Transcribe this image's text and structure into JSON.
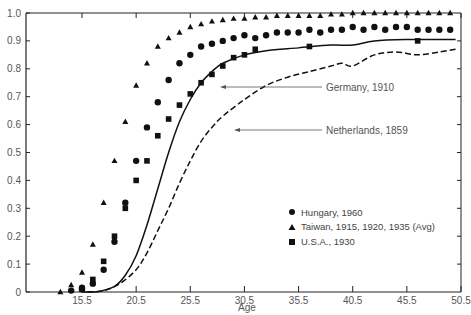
{
  "chart_data": {
    "type": "scatter",
    "title": "",
    "xlabel": "Age",
    "ylabel": "",
    "xlim": [
      10.5,
      50.5
    ],
    "ylim": [
      0,
      1.0
    ],
    "grid": false,
    "legend_position": "lower right",
    "x_ticks": [
      15.5,
      20.5,
      25.5,
      30.5,
      35.5,
      40.5,
      45.5,
      50.5
    ],
    "x_tick_labels": [
      "15.5",
      "20.5",
      "25.5",
      "30.5",
      "35.5",
      "40.5",
      "45.5",
      "50.5"
    ],
    "y_ticks": [
      0,
      0.1,
      0.2,
      0.3,
      0.4,
      0.5,
      0.6,
      0.7,
      0.8,
      0.9,
      1.0
    ],
    "y_tick_labels": [
      "0",
      "0.1",
      "0.2",
      "0.3",
      "0.4",
      "0.5",
      "0.6",
      "0.7",
      "0.8",
      "0.9",
      "1.0"
    ],
    "series": [
      {
        "name": "Hungary, 1960",
        "marker": "circle",
        "x": [
          14.5,
          15.5,
          15.5,
          16.5,
          17.5,
          18.5,
          19.5,
          20.5,
          21.5,
          22.5,
          23.5,
          24.5,
          25.5,
          26.5,
          27.5,
          28.5,
          29.5,
          30.5,
          31.5,
          32.5,
          33.5,
          34.5,
          35.5,
          36.5,
          37.5,
          38.5,
          39.5,
          40.5,
          41.5,
          42.5,
          43.5,
          44.5,
          45.5,
          46.5,
          47.5,
          48.5,
          49.5
        ],
        "values": [
          0.005,
          0.01,
          0.015,
          0.03,
          0.08,
          0.18,
          0.32,
          0.47,
          0.59,
          0.68,
          0.76,
          0.82,
          0.85,
          0.88,
          0.89,
          0.9,
          0.91,
          0.92,
          0.91,
          0.92,
          0.93,
          0.93,
          0.93,
          0.94,
          0.93,
          0.94,
          0.94,
          0.95,
          0.94,
          0.95,
          0.94,
          0.95,
          0.95,
          0.94,
          0.94,
          0.94,
          0.94
        ]
      },
      {
        "name": "Taiwan, 1915, 1920, 1935 (Avg)",
        "marker": "triangle",
        "x": [
          13.5,
          14.5,
          15.5,
          16.5,
          17.5,
          18.5,
          19.5,
          20.5,
          21.5,
          22.5,
          23.5,
          24.5,
          25.5,
          26.5,
          27.5,
          28.5,
          29.5,
          30.5,
          31.5,
          32.5,
          33.5,
          34.5,
          35.5,
          36.5,
          37.5,
          38.5,
          39.5,
          40.5,
          41.5,
          42.5,
          43.5,
          44.5,
          45.5,
          46.5,
          47.5,
          48.5,
          49.5
        ],
        "values": [
          0.0,
          0.025,
          0.07,
          0.17,
          0.32,
          0.47,
          0.61,
          0.74,
          0.82,
          0.88,
          0.91,
          0.93,
          0.95,
          0.96,
          0.97,
          0.975,
          0.98,
          0.98,
          0.985,
          0.985,
          0.99,
          0.99,
          0.99,
          0.99,
          0.99,
          0.995,
          0.995,
          1.0,
          1.0,
          1.0,
          1.0,
          1.0,
          1.0,
          1.0,
          1.0,
          1.0,
          1.0
        ]
      },
      {
        "name": "U.S.A., 1930",
        "marker": "square",
        "x": [
          15.5,
          16.5,
          17.5,
          18.5,
          19.5,
          20.5,
          21.5,
          22.5,
          23.5,
          24.5,
          25.5,
          26.5,
          27.5,
          28.5,
          29.5,
          30.5,
          31.5,
          36.5,
          46.5
        ],
        "values": [
          0.01,
          0.045,
          0.11,
          0.2,
          0.3,
          0.4,
          0.47,
          0.56,
          0.62,
          0.67,
          0.71,
          0.75,
          0.78,
          0.81,
          0.84,
          0.85,
          0.87,
          0.88,
          0.9
        ]
      },
      {
        "name": "Germany, 1910",
        "marker": "line-solid",
        "x": [
          15.5,
          17.0,
          18.5,
          19.5,
          20.5,
          21.5,
          22.5,
          23.5,
          24.5,
          25.5,
          26.5,
          27.5,
          28.5,
          30.5,
          32.5,
          35.5,
          38.5,
          40.5,
          42.5,
          45.5,
          48.5,
          50.0
        ],
        "values": [
          0.0,
          0.002,
          0.02,
          0.06,
          0.13,
          0.24,
          0.37,
          0.5,
          0.61,
          0.69,
          0.75,
          0.79,
          0.82,
          0.85,
          0.865,
          0.875,
          0.885,
          0.885,
          0.9,
          0.905,
          0.905,
          0.905
        ]
      },
      {
        "name": "Netherlands, 1859",
        "marker": "line-dashed",
        "x": [
          16.0,
          17.5,
          19.0,
          20.5,
          21.5,
          22.5,
          23.5,
          24.5,
          25.5,
          26.5,
          27.5,
          28.5,
          30.5,
          32.5,
          34.5,
          36.5,
          38.5,
          39.5,
          40.5,
          42.5,
          44.5,
          46.5,
          48.5,
          50.0
        ],
        "values": [
          0.0,
          0.005,
          0.03,
          0.08,
          0.14,
          0.22,
          0.3,
          0.39,
          0.47,
          0.54,
          0.59,
          0.63,
          0.69,
          0.74,
          0.77,
          0.79,
          0.81,
          0.82,
          0.81,
          0.85,
          0.86,
          0.85,
          0.86,
          0.87
        ]
      }
    ],
    "legend": [
      {
        "marker": "circle",
        "label": "Hungary, 1960"
      },
      {
        "marker": "triangle",
        "label": "Taiwan, 1915, 1920, 1935 (Avg)"
      },
      {
        "marker": "square",
        "label": "U.S.A., 1930"
      }
    ],
    "annotations": [
      {
        "text": "Germany, 1910",
        "arrow_to_x": 25.2,
        "arrow_to_y": 0.73
      },
      {
        "text": "Netherlands, 1859",
        "arrow_to_x": 26.5,
        "arrow_to_y": 0.58
      }
    ]
  }
}
